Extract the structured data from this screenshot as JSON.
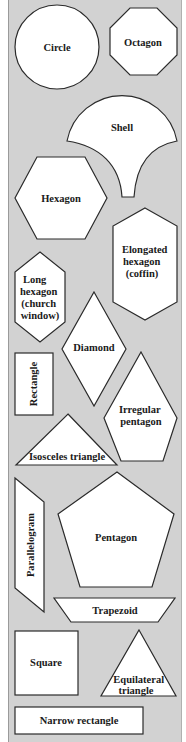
{
  "figure": {
    "background_color": "#d2d2d2",
    "shape_fill": "#ffffff",
    "shape_stroke": "#2a2a2a",
    "shapes": {
      "circle": {
        "label": "Circle"
      },
      "octagon": {
        "label": "Octagon"
      },
      "shell": {
        "label": "Shell"
      },
      "hexagon": {
        "label": "Hexagon"
      },
      "elongated_hexagon": {
        "lines": [
          "Elongated",
          "hexagon",
          "(coffin)"
        ]
      },
      "long_hexagon": {
        "lines": [
          "Long",
          "hexagon",
          "(church",
          "window)"
        ]
      },
      "diamond": {
        "label": "Diamond"
      },
      "rectangle": {
        "label": "Rectangle"
      },
      "irregular_pentagon": {
        "lines": [
          "Irregular",
          "pentagon"
        ]
      },
      "isosceles_triangle": {
        "label": "Isosceles triangle"
      },
      "parallelogram": {
        "label": "Parallelogram"
      },
      "pentagon": {
        "label": "Pentagon"
      },
      "trapezoid": {
        "label": "Trapezoid"
      },
      "square": {
        "label": "Square"
      },
      "equilateral_triangle": {
        "lines": [
          "Equilateral",
          "triangle"
        ]
      },
      "narrow_rectangle": {
        "label": "Narrow rectangle"
      }
    }
  }
}
